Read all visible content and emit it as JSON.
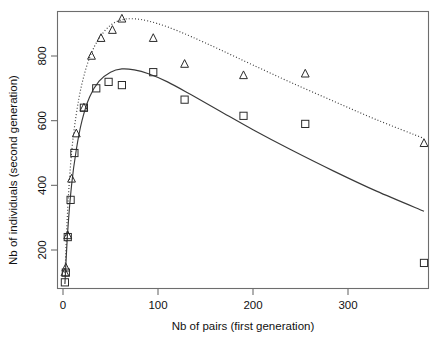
{
  "chart_data": {
    "type": "scatter",
    "title": "",
    "xlabel": "Nb of pairs (first generation)",
    "ylabel": "Nb of individuals (second generation)",
    "xlim": [
      -12,
      395
    ],
    "ylim": [
      55,
      960
    ],
    "xticks": [
      0,
      100,
      200,
      300
    ],
    "yticks": [
      200,
      400,
      600,
      800
    ],
    "xtick_labels": [
      "0",
      "100",
      "200",
      "300"
    ],
    "ytick_labels": [
      "200",
      "400",
      "600",
      "800"
    ],
    "grid": false,
    "legend": "none",
    "series": [
      {
        "name": "squares",
        "marker": "square",
        "line_style": "solid",
        "points": [
          [
            2,
            100
          ],
          [
            3,
            130
          ],
          [
            5,
            240
          ],
          [
            8,
            355
          ],
          [
            12,
            500
          ],
          [
            22,
            640
          ],
          [
            35,
            700
          ],
          [
            48,
            720
          ],
          [
            62,
            710
          ],
          [
            95,
            750
          ],
          [
            128,
            665
          ],
          [
            190,
            615
          ],
          [
            255,
            590
          ],
          [
            380,
            160
          ]
        ],
        "fit_curve": [
          [
            2,
            95
          ],
          [
            5,
            260
          ],
          [
            9,
            400
          ],
          [
            14,
            510
          ],
          [
            20,
            600
          ],
          [
            28,
            673
          ],
          [
            38,
            722
          ],
          [
            50,
            750
          ],
          [
            62,
            760
          ],
          [
            75,
            757
          ],
          [
            90,
            745
          ],
          [
            110,
            720
          ],
          [
            135,
            680
          ],
          [
            165,
            630
          ],
          [
            200,
            572
          ],
          [
            240,
            510
          ],
          [
            285,
            444
          ],
          [
            330,
            382
          ],
          [
            380,
            320
          ]
        ]
      },
      {
        "name": "triangles",
        "marker": "triangle",
        "line_style": "dotted",
        "points": [
          [
            2,
            130
          ],
          [
            3,
            145
          ],
          [
            5,
            245
          ],
          [
            9,
            420
          ],
          [
            14,
            560
          ],
          [
            22,
            640
          ],
          [
            30,
            800
          ],
          [
            40,
            855
          ],
          [
            52,
            880
          ],
          [
            62,
            915
          ],
          [
            95,
            855
          ],
          [
            128,
            775
          ],
          [
            190,
            740
          ],
          [
            255,
            745
          ],
          [
            380,
            530
          ]
        ],
        "fit_curve": [
          [
            2,
            120
          ],
          [
            5,
            330
          ],
          [
            9,
            500
          ],
          [
            14,
            620
          ],
          [
            20,
            715
          ],
          [
            28,
            795
          ],
          [
            38,
            855
          ],
          [
            50,
            895
          ],
          [
            62,
            912
          ],
          [
            75,
            915
          ],
          [
            90,
            908
          ],
          [
            110,
            890
          ],
          [
            135,
            860
          ],
          [
            165,
            820
          ],
          [
            200,
            772
          ],
          [
            240,
            718
          ],
          [
            285,
            660
          ],
          [
            330,
            603
          ],
          [
            380,
            545
          ]
        ]
      }
    ]
  }
}
